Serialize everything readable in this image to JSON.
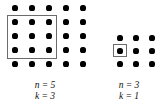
{
  "figure": {
    "type": "lattice-selection-diagram",
    "background_color": "#ffffff",
    "dot_color": "#000000",
    "box_color": "#6b6b6b"
  },
  "panels": [
    {
      "id": "left-panel",
      "grid_label": "5 by 5 dot lattice",
      "grid_columns": 5,
      "grid_rows": 5,
      "dot_origin_x": 15,
      "dot_origin_y": 8,
      "dot_step_x": 17,
      "dot_step_y": 14,
      "dot_radius": 2.6,
      "selection": {
        "x": 7,
        "y": 15,
        "width": 50,
        "height": 44,
        "covers_columns": 3,
        "covers_rows": 3
      },
      "caption": {
        "x": 0,
        "y": 80,
        "width": 90,
        "line1": "n = 5",
        "line2": "k = 3",
        "n_value": 5,
        "k_value": 3
      }
    },
    {
      "id": "right-panel",
      "grid_label": "3 by 3 dot lattice",
      "grid_columns": 3,
      "grid_rows": 3,
      "dot_origin_x": 120,
      "dot_origin_y": 38,
      "dot_step_x": 16,
      "dot_step_y": 13,
      "dot_radius": 2.6,
      "selection": {
        "x": 113,
        "y": 44,
        "width": 14,
        "height": 13,
        "covers_columns": 1,
        "covers_rows": 1
      },
      "caption": {
        "x": 93,
        "y": 80,
        "width": 72,
        "line1": "n = 3",
        "line2": "k = 1",
        "n_value": 3,
        "k_value": 1
      }
    }
  ]
}
